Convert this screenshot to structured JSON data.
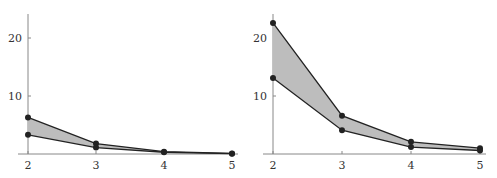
{
  "chart_data": [
    {
      "type": "area",
      "title": "",
      "xlabel": "",
      "ylabel": "",
      "x": [
        2,
        3,
        4,
        5
      ],
      "xticks": [
        "2",
        "3",
        "4",
        "5"
      ],
      "yticks": [
        "10",
        "20"
      ],
      "ylim": [
        0,
        24
      ],
      "grid": false,
      "series": [
        {
          "name": "upper",
          "values": [
            6.3,
            1.8,
            0.4,
            0.1
          ]
        },
        {
          "name": "lower",
          "values": [
            3.3,
            1.1,
            0.3,
            0.05
          ]
        }
      ],
      "fill_between": true
    },
    {
      "type": "area",
      "title": "",
      "xlabel": "",
      "ylabel": "",
      "x": [
        2,
        3,
        4,
        5
      ],
      "xticks": [
        "2",
        "3",
        "4",
        "5"
      ],
      "yticks": [
        "10",
        "20"
      ],
      "ylim": [
        0,
        24
      ],
      "grid": false,
      "series": [
        {
          "name": "upper",
          "values": [
            22.6,
            6.6,
            2.1,
            1.0
          ]
        },
        {
          "name": "lower",
          "values": [
            13.1,
            4.1,
            1.2,
            0.6
          ]
        }
      ],
      "fill_between": true
    }
  ],
  "style": {
    "fill_color": "#bdbdbd",
    "line_color": "#222222",
    "axis_color": "#888888"
  }
}
